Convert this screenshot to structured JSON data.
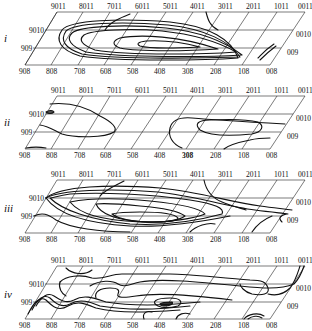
{
  "figure": {
    "type": "perspective contour panels",
    "panels": [
      {
        "id": "i",
        "label": "i",
        "top_labels": [
          "9011",
          "8011",
          "7011",
          "6011",
          "5011",
          "4011",
          "3011",
          "2011",
          "1011",
          "0011"
        ],
        "bottom_labels": [
          "908",
          "808",
          "708",
          "608",
          "508",
          "408",
          "308",
          "208",
          "108",
          "008"
        ],
        "left_labels": [
          "9010",
          "909"
        ],
        "right_labels": [
          "0010",
          "009"
        ]
      },
      {
        "id": "ii",
        "label": "ii",
        "top_labels": [
          "9011",
          "8011",
          "7011",
          "6011",
          "5011",
          "4011",
          "3011",
          "2011",
          "1011",
          "0011"
        ],
        "bottom_labels": [
          "908",
          "808",
          "708",
          "608",
          "508",
          "408",
          "308",
          "208",
          "108",
          "008"
        ],
        "left_labels": [
          "9010",
          "909"
        ],
        "right_labels": [
          "0010",
          "009"
        ]
      },
      {
        "id": "iii",
        "label": "iii",
        "top_labels": [
          "9011",
          "8011",
          "7011",
          "6011",
          "5011",
          "4011",
          "3011",
          "2011",
          "1011",
          "0011"
        ],
        "bottom_labels": [
          "908",
          "808",
          "708",
          "608",
          "508",
          "408",
          "308",
          "208",
          "108",
          "008"
        ],
        "left_labels": [
          "9010",
          "909"
        ],
        "right_labels": [
          "0010",
          "009"
        ]
      },
      {
        "id": "iv",
        "label": "iv",
        "top_labels": [
          "9011",
          "8011",
          "7011",
          "6011",
          "5011",
          "4011",
          "3011",
          "2011",
          "1011",
          "0011"
        ],
        "bottom_labels": [
          "908",
          "808",
          "708",
          "608",
          "508",
          "408",
          "308",
          "208",
          "108",
          "008"
        ],
        "left_labels": [
          "9010",
          "909"
        ],
        "right_labels": [
          "0010",
          "009"
        ]
      }
    ]
  }
}
